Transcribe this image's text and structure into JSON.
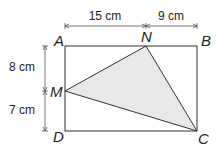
{
  "diagram": {
    "type": "geometry",
    "shape": "rectangle-with-inscribed-triangle",
    "points": {
      "A": "A",
      "B": "B",
      "C": "C",
      "D": "D",
      "M": "M",
      "N": "N"
    },
    "dimensions": {
      "AN": "15 cm",
      "NB": "9 cm",
      "AM": "8 cm",
      "MD": "7 cm"
    },
    "triangle": "MNC",
    "colors": {
      "stroke": "#333333",
      "fill": "#e8e8e8",
      "dimension_line": "#555555"
    }
  }
}
